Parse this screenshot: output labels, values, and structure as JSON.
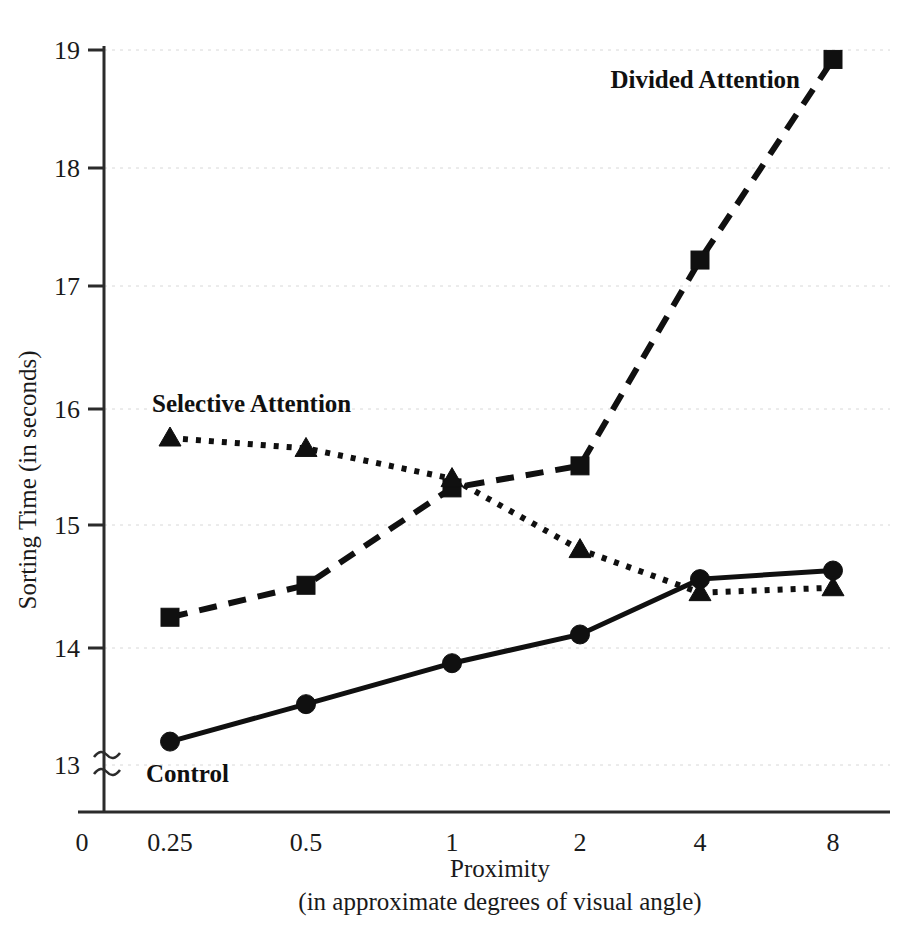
{
  "chart_data": {
    "type": "line",
    "title": "",
    "xlabel": "Proximity",
    "xlabel_sub": "(in approximate degrees of visual angle)",
    "ylabel": "Sorting Time (in seconds)",
    "categories": [
      "0.25",
      "0.5",
      "1",
      "2",
      "4",
      "8"
    ],
    "x_tick_labels": [
      "0",
      "0.25",
      "0.5",
      "1",
      "2",
      "4",
      "8"
    ],
    "y_tick_labels": [
      "13",
      "14",
      "15",
      "16",
      "17",
      "18",
      "19"
    ],
    "ylim": [
      13,
      19
    ],
    "y_axis_break": true,
    "grid": true,
    "legend": "inline-annotations",
    "series": [
      {
        "name": "Control",
        "marker": "circle",
        "line_style": "solid",
        "values": [
          13.2,
          13.52,
          13.87,
          14.11,
          14.56,
          14.63
        ]
      },
      {
        "name": "Divided Attention",
        "marker": "square",
        "line_style": "dashed",
        "values": [
          14.25,
          14.51,
          15.32,
          15.51,
          17.22,
          18.92
        ]
      },
      {
        "name": "Selective Attention",
        "marker": "triangle",
        "line_style": "dotted",
        "values": [
          15.75,
          15.66,
          15.4,
          14.8,
          14.45,
          14.49
        ]
      }
    ],
    "annotations": [
      {
        "text": "Divided Attention",
        "series": "Divided Attention"
      },
      {
        "text": "Selective Attention",
        "series": "Selective Attention"
      },
      {
        "text": "Control",
        "series": "Control"
      }
    ],
    "colors": {
      "ink": "#101010",
      "grid": "#d8d8d8",
      "axis": "#2b2b2b",
      "background": "#ffffff"
    }
  }
}
